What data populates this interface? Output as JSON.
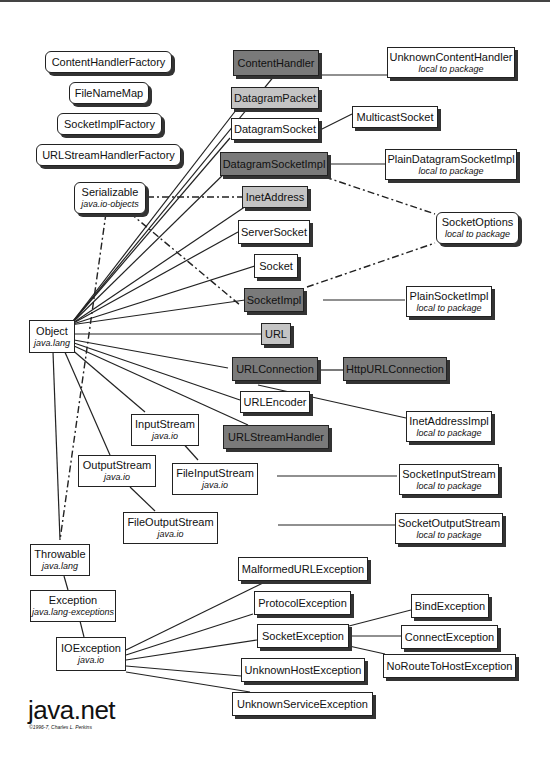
{
  "title": "java.net",
  "copyright": "©1996-7, Charles L. Perkins",
  "colors": {
    "abstract_class": "#7a7a7a",
    "final_class": "#c4c4c4",
    "class": "#ffffff",
    "line": "#222222"
  },
  "interfaces": [
    {
      "id": "ContentHandlerFactory",
      "label": "ContentHandlerFactory"
    },
    {
      "id": "FileNameMap",
      "label": "FileNameMap"
    },
    {
      "id": "SocketImplFactory",
      "label": "SocketImplFactory"
    },
    {
      "id": "URLStreamHandlerFactory",
      "label": "URLStreamHandlerFactory"
    },
    {
      "id": "Serializable",
      "label": "Serializable",
      "sub": "java.io-objects"
    },
    {
      "id": "SocketOptions",
      "label": "SocketOptions",
      "sub": "local to package"
    }
  ],
  "classes": {
    "Object": {
      "label": "Object",
      "sub": "java.lang"
    },
    "ContentHandler": {
      "label": "ContentHandler"
    },
    "DatagramPacket": {
      "label": "DatagramPacket"
    },
    "DatagramSocket": {
      "label": "DatagramSocket"
    },
    "DatagramSocketImpl": {
      "label": "DatagramSocketImpl"
    },
    "InetAddress": {
      "label": "InetAddress"
    },
    "ServerSocket": {
      "label": "ServerSocket"
    },
    "Socket": {
      "label": "Socket"
    },
    "SocketImpl": {
      "label": "SocketImpl"
    },
    "URL": {
      "label": "URL"
    },
    "URLConnection": {
      "label": "URLConnection"
    },
    "URLEncoder": {
      "label": "URLEncoder"
    },
    "URLStreamHandler": {
      "label": "URLStreamHandler"
    },
    "UnknownContentHandler": {
      "label": "UnknownContentHandler",
      "sub": "local to package"
    },
    "MulticastSocket": {
      "label": "MulticastSocket"
    },
    "PlainDatagramSocketImpl": {
      "label": "PlainDatagramSocketImpl",
      "sub": "local to package"
    },
    "PlainSocketImpl": {
      "label": "PlainSocketImpl",
      "sub": "local to package"
    },
    "HttpURLConnection": {
      "label": "HttpURLConnection"
    },
    "InetAddressImpl": {
      "label": "InetAddressImpl",
      "sub": "local to package"
    },
    "InputStream": {
      "label": "InputStream",
      "sub": "java.io"
    },
    "OutputStream": {
      "label": "OutputStream",
      "sub": "java.io"
    },
    "FileInputStream": {
      "label": "FileInputStream",
      "sub": "java.io"
    },
    "FileOutputStream": {
      "label": "FileOutputStream",
      "sub": "java.io"
    },
    "SocketInputStream": {
      "label": "SocketInputStream",
      "sub": "local to package"
    },
    "SocketOutputStream": {
      "label": "SocketOutputStream",
      "sub": "local to package"
    },
    "Throwable": {
      "label": "Throwable",
      "sub": "java.lang"
    },
    "Exception": {
      "label": "Exception",
      "sub": "java.lang-exceptions"
    },
    "IOException": {
      "label": "IOException",
      "sub": "java.io"
    },
    "MalformedURLException": {
      "label": "MalformedURLException"
    },
    "ProtocolException": {
      "label": "ProtocolException"
    },
    "SocketException": {
      "label": "SocketException"
    },
    "UnknownHostException": {
      "label": "UnknownHostException"
    },
    "UnknownServiceException": {
      "label": "UnknownServiceException"
    },
    "BindException": {
      "label": "BindException"
    },
    "ConnectException": {
      "label": "ConnectException"
    },
    "NoRouteToHostException": {
      "label": "NoRouteToHostException"
    }
  }
}
